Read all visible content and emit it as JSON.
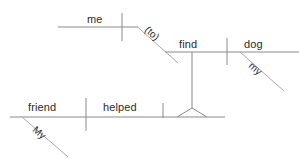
{
  "diagram": {
    "type": "reed-kellogg-sentence-diagram",
    "sentence": "My friend helped find my dog (to) me",
    "stroke_color": "#8a8a8a",
    "text_color": "#2b2b2b",
    "background_color": "#ffffff",
    "labels": {
      "me": "me",
      "to": "(to)",
      "find": "find",
      "dog": "dog",
      "my_dog_modifier": "my",
      "friend": "friend",
      "helped": "helped",
      "my_friend_modifier": "My"
    },
    "branches": [
      {
        "id": "indirect-object-branch",
        "name": "me-branch",
        "word": "me",
        "preposition": "(to)",
        "baseline_y": 27
      },
      {
        "id": "infinitive-branch",
        "name": "find-dog-branch",
        "subject": "find",
        "object": "dog",
        "modifier": "my",
        "baseline_y": 52
      },
      {
        "id": "main-clause",
        "name": "friend-helped-branch",
        "subject": "friend",
        "verb": "helped",
        "modifier": "My",
        "baseline_y": 117
      }
    ]
  }
}
